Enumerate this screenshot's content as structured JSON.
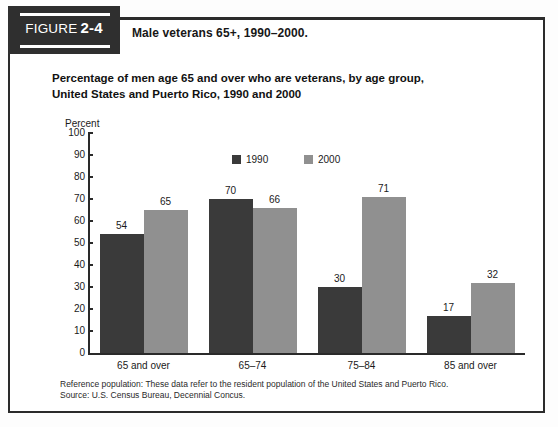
{
  "figure": {
    "badge_word": "FIGURE",
    "badge_number": "2-4",
    "caption": "Male veterans 65+, 1990–2000."
  },
  "chart_title_line1": "Percentage of men age 65 and over who are veterans, by age group,",
  "chart_title_line2": "United States and Puerto Rico, 1990 and 2000",
  "footnote": {
    "reference": "Reference population: These data refer to the resident population of the United States and Puerto Rico.",
    "source": "Source: U.S. Census Bureau, Decennial Concus."
  },
  "colors": {
    "series_1990": "#3a3a3a",
    "series_2000": "#909090",
    "axis": "#2a2a2a",
    "badge_bg": "#2f2f2f",
    "frame": "#2b2b2b"
  },
  "chart_data": {
    "type": "bar",
    "title": "Percentage of men age 65 and over who are veterans, by age group, United States and Puerto Rico, 1990 and 2000",
    "xlabel": "",
    "ylabel": "Percent",
    "ylim": [
      0,
      100
    ],
    "ytick_step": 10,
    "yticks": [
      "100",
      "90",
      "80",
      "70",
      "60",
      "50",
      "40",
      "30",
      "20",
      "10",
      "0"
    ],
    "grid": false,
    "legend_position": "top-center",
    "categories": [
      "65 and over",
      "65–74",
      "75–84",
      "85 and over"
    ],
    "series": [
      {
        "name": "1990",
        "color": "#3a3a3a",
        "values": [
          54,
          70,
          30,
          17
        ]
      },
      {
        "name": "2000",
        "color": "#909090",
        "values": [
          65,
          66,
          71,
          32
        ]
      }
    ]
  }
}
